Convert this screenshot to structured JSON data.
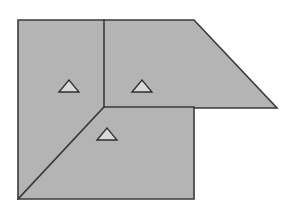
{
  "document": {
    "title": "Roof Plan Diagram",
    "background_color": "#ffffff"
  },
  "diagram": {
    "name": "roof-plan",
    "type": "line-drawing",
    "canvas": {
      "width": 299,
      "height": 217
    },
    "style": {
      "fill_color": "#b4b4b4",
      "stroke_color": "#3a3a3a",
      "stroke_width": 1.6,
      "divider_color": "#3a3a3a",
      "divider_width": 1.6,
      "symbol_fill_color": "#d9d9d9",
      "symbol_stroke_color": "#2e2e2e",
      "symbol_stroke_width": 1.3
    },
    "outline": {
      "name": "roof-outline",
      "description": "L-shaped roof footprint with a sloping right wing",
      "points": "18,20 194,20 277,108 194,108 194,199 18,199"
    },
    "dividers": [
      {
        "name": "ridge-line-vertical",
        "description": "vertical ridge from top edge down to central hip point",
        "x1": 104,
        "y1": 20,
        "x2": 104,
        "y2": 107
      },
      {
        "name": "ridge-line-horizontal",
        "description": "horizontal ridge from central hip point to right wing corner",
        "x1": 104,
        "y1": 107,
        "x2": 194,
        "y2": 107
      },
      {
        "name": "hip-line-diagonal",
        "description": "diagonal hip from central hip point down to bottom-left corner",
        "x1": 104,
        "y1": 107,
        "x2": 18,
        "y2": 199
      }
    ],
    "symbols": [
      {
        "name": "slope-triangle-left",
        "label": "triangle-marker",
        "cx": 69,
        "cy": 86,
        "half_width": 10,
        "height": 12
      },
      {
        "name": "slope-triangle-center",
        "label": "triangle-marker",
        "cx": 142,
        "cy": 86,
        "half_width": 10,
        "height": 12
      },
      {
        "name": "slope-triangle-bottom",
        "label": "triangle-marker",
        "cx": 107,
        "cy": 134,
        "half_width": 10,
        "height": 12
      }
    ]
  }
}
